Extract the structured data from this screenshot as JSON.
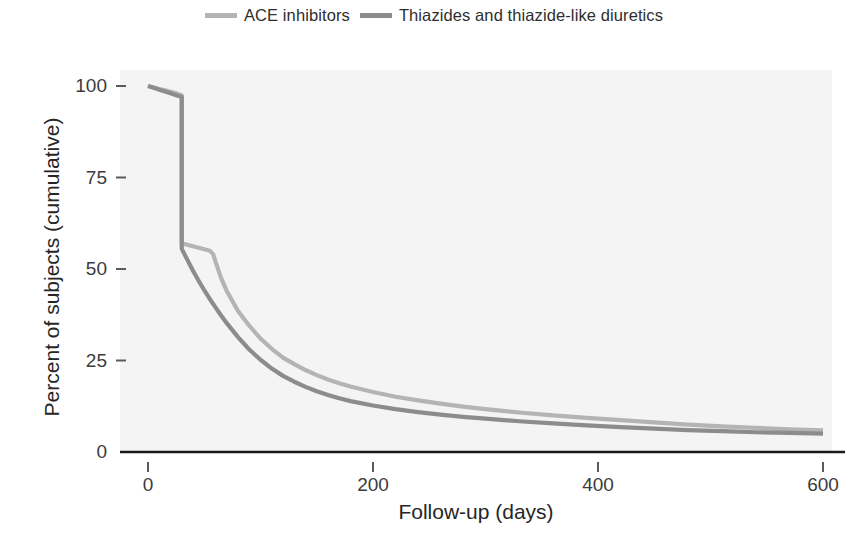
{
  "legend": {
    "position": "top-center",
    "entries": [
      {
        "label": "ACE inhibitors",
        "color": "#b4b4b4",
        "swatch_name": "legend-swatch-ace-inhibitors"
      },
      {
        "label": "Thiazides and thiazide-like diuretics",
        "color": "#8c8c8c",
        "swatch_name": "legend-swatch-thiazides"
      }
    ]
  },
  "axes": {
    "x_title": "Follow-up (days)",
    "y_title": "Percent of subjects (cumulative)",
    "x_ticks": [
      "0",
      "200",
      "400",
      "600"
    ],
    "y_ticks": [
      "0",
      "25",
      "50",
      "75",
      "100"
    ]
  },
  "chart_data": {
    "type": "line",
    "title": "",
    "subtitle": "",
    "xlabel": "Follow-up (days)",
    "ylabel": "Percent of subjects (cumulative)",
    "xlim": [
      0,
      600
    ],
    "ylim": [
      0,
      100
    ],
    "xticks": [
      0,
      200,
      400,
      600
    ],
    "yticks": [
      0,
      25,
      50,
      75,
      100
    ],
    "grid": false,
    "legend_position": "top-center",
    "series": [
      {
        "name": "ACE inhibitors",
        "color": "#b4b4b4",
        "x": [
          0,
          5,
          10,
          15,
          20,
          25,
          28,
          30,
          30,
          35,
          40,
          45,
          50,
          55,
          58,
          60,
          65,
          70,
          80,
          90,
          100,
          110,
          120,
          130,
          140,
          150,
          160,
          170,
          180,
          200,
          220,
          240,
          260,
          280,
          300,
          330,
          360,
          390,
          420,
          450,
          480,
          510,
          540,
          570,
          600
        ],
        "y": [
          100,
          99.6,
          99.2,
          98.8,
          98.4,
          98.0,
          97.7,
          97.5,
          57.0,
          56.6,
          56.2,
          55.8,
          55.4,
          55.0,
          54.0,
          52.0,
          47.5,
          44.0,
          38.5,
          34.5,
          31.0,
          28.2,
          25.8,
          24.0,
          22.4,
          21.0,
          19.8,
          18.8,
          17.9,
          16.4,
          15.1,
          14.1,
          13.2,
          12.4,
          11.7,
          10.8,
          10.0,
          9.3,
          8.7,
          8.1,
          7.5,
          7.0,
          6.6,
          6.2,
          5.9
        ]
      },
      {
        "name": "Thiazides and thiazide-like diuretics",
        "color": "#8c8c8c",
        "x": [
          0,
          5,
          10,
          15,
          20,
          25,
          28,
          30,
          30,
          35,
          40,
          45,
          50,
          55,
          60,
          65,
          70,
          80,
          90,
          100,
          110,
          120,
          130,
          140,
          150,
          160,
          170,
          180,
          200,
          220,
          240,
          260,
          280,
          300,
          330,
          360,
          390,
          420,
          450,
          480,
          510,
          540,
          570,
          600
        ],
        "y": [
          100,
          99.5,
          99.0,
          98.5,
          98.0,
          97.5,
          97.2,
          97.0,
          55.5,
          52.5,
          49.5,
          46.8,
          44.2,
          41.8,
          39.5,
          37.3,
          35.2,
          31.4,
          28.0,
          25.2,
          22.8,
          20.8,
          19.2,
          17.8,
          16.6,
          15.6,
          14.7,
          13.9,
          12.7,
          11.7,
          10.9,
          10.2,
          9.6,
          9.1,
          8.4,
          7.8,
          7.3,
          6.8,
          6.4,
          6.0,
          5.7,
          5.4,
          5.2,
          5.0
        ]
      }
    ],
    "annotations": [
      {
        "text": "Sharp drop at approximately day 30",
        "x": 30,
        "y": 56
      }
    ]
  },
  "style": {
    "plot_background": "#f4f4f4",
    "axis_line_color": "#1a1a1a",
    "tick_color": "#5a5a5a",
    "text_color": "#2e2e2e"
  }
}
